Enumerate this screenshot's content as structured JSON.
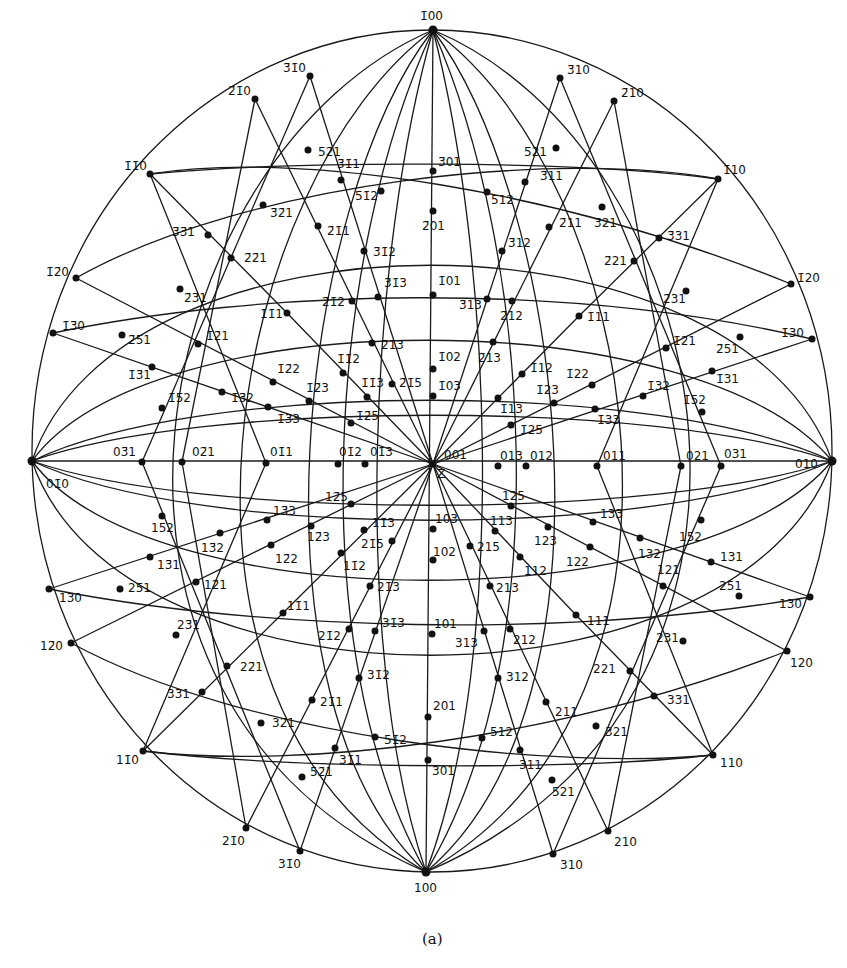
{
  "figure": {
    "caption": "(a)",
    "type": "stereographic projection",
    "center_label": "Z",
    "primitive_circle": {
      "cx": 432,
      "cy": 461,
      "rx": 400,
      "ry": 421
    }
  },
  "poles": [
    {
      "label": "1̄00",
      "x": 433,
      "y": 30,
      "lx": 420,
      "ly": 20
    },
    {
      "label": "100",
      "x": 426,
      "y": 872,
      "lx": 414,
      "ly": 892
    },
    {
      "label": "01̄0",
      "x": 32,
      "y": 461,
      "lx": 46,
      "ly": 488
    },
    {
      "label": "010",
      "x": 832,
      "y": 461,
      "lx": 795,
      "ly": 468
    },
    {
      "label": "3̄1̄0",
      "x": 310,
      "y": 76,
      "lx": 283,
      "ly": 72
    },
    {
      "label": "2̄1̄0",
      "x": 255,
      "y": 99,
      "lx": 228,
      "ly": 95
    },
    {
      "label": "1̄1̄0",
      "x": 150,
      "y": 174,
      "lx": 124,
      "ly": 170
    },
    {
      "label": "1̄2̄0",
      "x": 76,
      "y": 278,
      "lx": 46,
      "ly": 276
    },
    {
      "label": "1̄3̄0",
      "x": 53,
      "y": 333,
      "lx": 62,
      "ly": 330
    },
    {
      "label": "3̄10",
      "x": 560,
      "y": 78,
      "lx": 567,
      "ly": 74
    },
    {
      "label": "2̄10",
      "x": 614,
      "y": 101,
      "lx": 621,
      "ly": 97
    },
    {
      "label": "1̄10",
      "x": 718,
      "y": 179,
      "lx": 723,
      "ly": 174
    },
    {
      "label": "1̄20",
      "x": 791,
      "y": 284,
      "lx": 797,
      "ly": 282
    },
    {
      "label": "1̄30",
      "x": 812,
      "y": 339,
      "lx": 781,
      "ly": 337
    },
    {
      "label": "1̄30b",
      "x": 0,
      "y": 0,
      "lx": 0,
      "ly": 0,
      "hide": true
    },
    {
      "label": "1̄3̄1",
      "x": 152,
      "y": 367,
      "lx": 128,
      "ly": 379
    },
    {
      "label": "03̄1",
      "x": 142,
      "y": 462,
      "lx": 113,
      "ly": 456
    },
    {
      "label": "02̄1",
      "x": 182,
      "y": 462,
      "lx": 192,
      "ly": 456
    },
    {
      "label": "01̄1",
      "x": 266,
      "y": 463,
      "lx": 270,
      "ly": 456
    },
    {
      "label": "01̄2",
      "x": 338,
      "y": 464,
      "lx": 339,
      "ly": 456
    },
    {
      "label": "01̄3",
      "x": 365,
      "y": 464,
      "lx": 370,
      "ly": 456
    },
    {
      "label": "001",
      "x": 433,
      "y": 464,
      "lx": 444,
      "ly": 459
    },
    {
      "label": "013",
      "x": 498,
      "y": 466,
      "lx": 500,
      "ly": 460
    },
    {
      "label": "012",
      "x": 526,
      "y": 466,
      "lx": 530,
      "ly": 460
    },
    {
      "label": "011",
      "x": 597,
      "y": 466,
      "lx": 603,
      "ly": 460
    },
    {
      "label": "021",
      "x": 681,
      "y": 466,
      "lx": 686,
      "ly": 460
    },
    {
      "label": "031",
      "x": 721,
      "y": 466,
      "lx": 724,
      "ly": 458
    },
    {
      "label": "5̄2̄1",
      "x": 308,
      "y": 150,
      "lx": 318,
      "ly": 156
    },
    {
      "label": "3̄1̄1",
      "x": 341,
      "y": 180,
      "lx": 337,
      "ly": 168
    },
    {
      "label": "5̄1̄2",
      "x": 381,
      "y": 191,
      "lx": 355,
      "ly": 200
    },
    {
      "label": "3̄01",
      "x": 433,
      "y": 171,
      "lx": 438,
      "ly": 166
    },
    {
      "label": "2̄01",
      "x": 433,
      "y": 211,
      "lx": 422,
      "ly": 230
    },
    {
      "label": "5̄12",
      "x": 487,
      "y": 192,
      "lx": 491,
      "ly": 204
    },
    {
      "label": "3̄11",
      "x": 525,
      "y": 182,
      "lx": 540,
      "ly": 180
    },
    {
      "label": "5̄21",
      "x": 556,
      "y": 148,
      "lx": 524,
      "ly": 156
    },
    {
      "label": "3̄2̄1",
      "x": 263,
      "y": 205,
      "lx": 270,
      "ly": 217
    },
    {
      "label": "3̄3̄1",
      "x": 208,
      "y": 235,
      "lx": 172,
      "ly": 236
    },
    {
      "label": "2̄1̄1",
      "x": 318,
      "y": 226,
      "lx": 327,
      "ly": 235
    },
    {
      "label": "2̄11",
      "x": 549,
      "y": 227,
      "lx": 559,
      "ly": 227
    },
    {
      "label": "3̄21",
      "x": 602,
      "y": 207,
      "lx": 594,
      "ly": 227
    },
    {
      "label": "3̄31",
      "x": 659,
      "y": 238,
      "lx": 667,
      "ly": 240
    },
    {
      "label": "2̄2̄1",
      "x": 231,
      "y": 258,
      "lx": 244,
      "ly": 262
    },
    {
      "label": "3̄1̄2",
      "x": 364,
      "y": 251,
      "lx": 373,
      "ly": 256
    },
    {
      "label": "3̄12",
      "x": 502,
      "y": 251,
      "lx": 508,
      "ly": 247
    },
    {
      "label": "2̄21",
      "x": 634,
      "y": 261,
      "lx": 604,
      "ly": 265
    },
    {
      "label": "2̄3̄1",
      "x": 180,
      "y": 289,
      "lx": 184,
      "ly": 302
    },
    {
      "label": "3̄1̄3",
      "x": 378,
      "y": 297,
      "lx": 384,
      "ly": 287
    },
    {
      "label": "1̄01",
      "x": 433,
      "y": 295,
      "lx": 438,
      "ly": 285
    },
    {
      "label": "3̄13",
      "x": 487,
      "y": 299,
      "lx": 459,
      "ly": 309
    },
    {
      "label": "2̄1̄2",
      "x": 352,
      "y": 301,
      "lx": 322,
      "ly": 306
    },
    {
      "label": "2̄12",
      "x": 512,
      "y": 301,
      "lx": 500,
      "ly": 320
    },
    {
      "label": "1̄1̄1",
      "x": 287,
      "y": 313,
      "lx": 260,
      "ly": 318
    },
    {
      "label": "1̄11",
      "x": 579,
      "y": 316,
      "lx": 587,
      "ly": 321
    },
    {
      "label": "2̄31",
      "x": 686,
      "y": 291,
      "lx": 663,
      "ly": 303
    },
    {
      "label": "2̄5̄1",
      "x": 122,
      "y": 335,
      "lx": 128,
      "ly": 344
    },
    {
      "label": "2̄51",
      "x": 740,
      "y": 337,
      "lx": 716,
      "ly": 353
    },
    {
      "label": "1̄2̄1",
      "x": 198,
      "y": 344,
      "lx": 206,
      "ly": 340
    },
    {
      "label": "1̄21",
      "x": 666,
      "y": 348,
      "lx": 673,
      "ly": 345
    },
    {
      "label": "2̄1̄3",
      "x": 372,
      "y": 343,
      "lx": 381,
      "ly": 349
    },
    {
      "label": "2̄13",
      "x": 493,
      "y": 342,
      "lx": 478,
      "ly": 362
    },
    {
      "label": "1̄1̄2",
      "x": 343,
      "y": 373,
      "lx": 337,
      "ly": 363
    },
    {
      "label": "1̄02",
      "x": 433,
      "y": 369,
      "lx": 438,
      "ly": 361
    },
    {
      "label": "1̄12",
      "x": 522,
      "y": 374,
      "lx": 530,
      "ly": 372
    },
    {
      "label": "1̄2̄2",
      "x": 273,
      "y": 382,
      "lx": 277,
      "ly": 373
    },
    {
      "label": "1̄22",
      "x": 592,
      "y": 385,
      "lx": 566,
      "ly": 378
    },
    {
      "label": "1̄1̄3",
      "x": 367,
      "y": 397,
      "lx": 361,
      "ly": 387
    },
    {
      "label": "2̄1̄5",
      "x": 392,
      "y": 384,
      "lx": 399,
      "ly": 387
    },
    {
      "label": "1̄03",
      "x": 433,
      "y": 396,
      "lx": 438,
      "ly": 390
    },
    {
      "label": "1̄13",
      "x": 498,
      "y": 398,
      "lx": 500,
      "ly": 413
    },
    {
      "label": "1̄23",
      "x": 554,
      "y": 403,
      "lx": 536,
      "ly": 394
    },
    {
      "label": "1̄1̄5",
      "x": 0,
      "y": 0,
      "lx": 0,
      "ly": 0,
      "hide": true
    },
    {
      "label": "1̄2̄3",
      "x": 309,
      "y": 401,
      "lx": 306,
      "ly": 392
    },
    {
      "label": "1̄3̄2",
      "x": 222,
      "y": 392,
      "lx": 231,
      "ly": 402
    },
    {
      "label": "1̄32",
      "x": 643,
      "y": 396,
      "lx": 647,
      "ly": 390
    },
    {
      "label": "1̄5̄2",
      "x": 162,
      "y": 408,
      "lx": 168,
      "ly": 402
    },
    {
      "label": "1̄52",
      "x": 702,
      "y": 412,
      "lx": 683,
      "ly": 404
    },
    {
      "label": "1̄31",
      "x": 712,
      "y": 371,
      "lx": 716,
      "ly": 383
    },
    {
      "label": "1̄3̄3",
      "x": 268,
      "y": 407,
      "lx": 277,
      "ly": 423
    },
    {
      "label": "1̄33",
      "x": 595,
      "y": 409,
      "lx": 597,
      "ly": 424
    },
    {
      "label": "1̄2̄5",
      "x": 351,
      "y": 423,
      "lx": 356,
      "ly": 420
    },
    {
      "label": "1̄25",
      "x": 511,
      "y": 425,
      "lx": 520,
      "ly": 434
    },
    {
      "label": "12̄5",
      "x": 351,
      "y": 504,
      "lx": 325,
      "ly": 501
    },
    {
      "label": "125",
      "x": 511,
      "y": 506,
      "lx": 502,
      "ly": 500
    },
    {
      "label": "13̄3",
      "x": 267,
      "y": 520,
      "lx": 273,
      "ly": 515
    },
    {
      "label": "133",
      "x": 593,
      "y": 522,
      "lx": 600,
      "ly": 518
    },
    {
      "label": "11̄3",
      "x": 364,
      "y": 530,
      "lx": 372,
      "ly": 527
    },
    {
      "label": "103",
      "x": 433,
      "y": 529,
      "lx": 435,
      "ly": 523
    },
    {
      "label": "113",
      "x": 495,
      "y": 531,
      "lx": 490,
      "ly": 525
    },
    {
      "label": "15̄2",
      "x": 162,
      "y": 516,
      "lx": 151,
      "ly": 532
    },
    {
      "label": "152",
      "x": 701,
      "y": 520,
      "lx": 679,
      "ly": 541
    },
    {
      "label": "12̄3",
      "x": 311,
      "y": 526,
      "lx": 307,
      "ly": 541
    },
    {
      "label": "123",
      "x": 548,
      "y": 527,
      "lx": 534,
      "ly": 545
    },
    {
      "label": "13̄2",
      "x": 220,
      "y": 533,
      "lx": 201,
      "ly": 552
    },
    {
      "label": "132",
      "x": 640,
      "y": 538,
      "lx": 638,
      "ly": 558
    },
    {
      "label": "21̄5",
      "x": 392,
      "y": 541,
      "lx": 361,
      "ly": 548
    },
    {
      "label": "215",
      "x": 470,
      "y": 546,
      "lx": 477,
      "ly": 551
    },
    {
      "label": "13̄1",
      "x": 150,
      "y": 557,
      "lx": 157,
      "ly": 569
    },
    {
      "label": "131",
      "x": 711,
      "y": 562,
      "lx": 720,
      "ly": 561
    },
    {
      "label": "12̄2",
      "x": 271,
      "y": 545,
      "lx": 275,
      "ly": 563
    },
    {
      "label": "102",
      "x": 433,
      "y": 560,
      "lx": 433,
      "ly": 556
    },
    {
      "label": "122",
      "x": 590,
      "y": 547,
      "lx": 566,
      "ly": 566
    },
    {
      "label": "11̄2",
      "x": 341,
      "y": 553,
      "lx": 343,
      "ly": 570
    },
    {
      "label": "112",
      "x": 520,
      "y": 557,
      "lx": 524,
      "ly": 575
    },
    {
      "label": "12̄1",
      "x": 196,
      "y": 582,
      "lx": 204,
      "ly": 589
    },
    {
      "label": "121",
      "x": 663,
      "y": 586,
      "lx": 657,
      "ly": 574
    },
    {
      "label": "25̄1",
      "x": 120,
      "y": 589,
      "lx": 128,
      "ly": 592
    },
    {
      "label": "251",
      "x": 739,
      "y": 596,
      "lx": 719,
      "ly": 590
    },
    {
      "label": "13̄0",
      "x": 49,
      "y": 589,
      "lx": 59,
      "ly": 602
    },
    {
      "label": "130",
      "x": 810,
      "y": 597,
      "lx": 779,
      "ly": 608
    },
    {
      "label": "21̄3",
      "x": 370,
      "y": 586,
      "lx": 377,
      "ly": 591
    },
    {
      "label": "213",
      "x": 490,
      "y": 586,
      "lx": 496,
      "ly": 592
    },
    {
      "label": "11̄1",
      "x": 283,
      "y": 613,
      "lx": 287,
      "ly": 610
    },
    {
      "label": "111",
      "x": 576,
      "y": 615,
      "lx": 587,
      "ly": 625
    },
    {
      "label": "23̄1",
      "x": 176,
      "y": 635,
      "lx": 177,
      "ly": 629
    },
    {
      "label": "231",
      "x": 683,
      "y": 641,
      "lx": 656,
      "ly": 642
    },
    {
      "label": "12̄0",
      "x": 71,
      "y": 643,
      "lx": 40,
      "ly": 650
    },
    {
      "label": "120",
      "x": 787,
      "y": 651,
      "lx": 790,
      "ly": 667
    },
    {
      "label": "21̄2",
      "x": 349,
      "y": 629,
      "lx": 318,
      "ly": 640
    },
    {
      "label": "31̄3",
      "x": 375,
      "y": 631,
      "lx": 382,
      "ly": 627
    },
    {
      "label": "101",
      "x": 432,
      "y": 634,
      "lx": 434,
      "ly": 628
    },
    {
      "label": "313",
      "x": 484,
      "y": 631,
      "lx": 455,
      "ly": 647
    },
    {
      "label": "212",
      "x": 510,
      "y": 629,
      "lx": 513,
      "ly": 644
    },
    {
      "label": "22̄1",
      "x": 227,
      "y": 666,
      "lx": 240,
      "ly": 671
    },
    {
      "label": "221",
      "x": 630,
      "y": 671,
      "lx": 593,
      "ly": 673
    },
    {
      "label": "31̄2",
      "x": 359,
      "y": 678,
      "lx": 367,
      "ly": 679
    },
    {
      "label": "312",
      "x": 498,
      "y": 678,
      "lx": 506,
      "ly": 681
    },
    {
      "label": "33̄1",
      "x": 202,
      "y": 692,
      "lx": 167,
      "ly": 698
    },
    {
      "label": "331",
      "x": 654,
      "y": 696,
      "lx": 667,
      "ly": 704
    },
    {
      "label": "21̄1",
      "x": 312,
      "y": 700,
      "lx": 320,
      "ly": 706
    },
    {
      "label": "201",
      "x": 428,
      "y": 717,
      "lx": 433,
      "ly": 710
    },
    {
      "label": "211",
      "x": 546,
      "y": 702,
      "lx": 555,
      "ly": 716
    },
    {
      "label": "32̄1",
      "x": 261,
      "y": 723,
      "lx": 272,
      "ly": 727
    },
    {
      "label": "321",
      "x": 596,
      "y": 726,
      "lx": 605,
      "ly": 736
    },
    {
      "label": "51̄2",
      "x": 375,
      "y": 737,
      "lx": 384,
      "ly": 744
    },
    {
      "label": "512",
      "x": 482,
      "y": 738,
      "lx": 490,
      "ly": 736
    },
    {
      "label": "31̄1",
      "x": 335,
      "y": 748,
      "lx": 339,
      "ly": 764
    },
    {
      "label": "311",
      "x": 520,
      "y": 750,
      "lx": 519,
      "ly": 769
    },
    {
      "label": "301",
      "x": 428,
      "y": 760,
      "lx": 432,
      "ly": 775
    },
    {
      "label": "52̄1",
      "x": 302,
      "y": 777,
      "lx": 310,
      "ly": 776
    },
    {
      "label": "521",
      "x": 552,
      "y": 780,
      "lx": 552,
      "ly": 796
    },
    {
      "label": "11̄0",
      "x": 143,
      "y": 751,
      "lx": 116,
      "ly": 764
    },
    {
      "label": "110",
      "x": 713,
      "y": 755,
      "lx": 720,
      "ly": 767
    },
    {
      "label": "21̄0",
      "x": 246,
      "y": 828,
      "lx": 222,
      "ly": 845
    },
    {
      "label": "210",
      "x": 608,
      "y": 831,
      "lx": 614,
      "ly": 846
    },
    {
      "label": "31̄0",
      "x": 300,
      "y": 851,
      "lx": 278,
      "ly": 868
    },
    {
      "label": "310",
      "x": 553,
      "y": 854,
      "lx": 560,
      "ly": 869
    }
  ]
}
